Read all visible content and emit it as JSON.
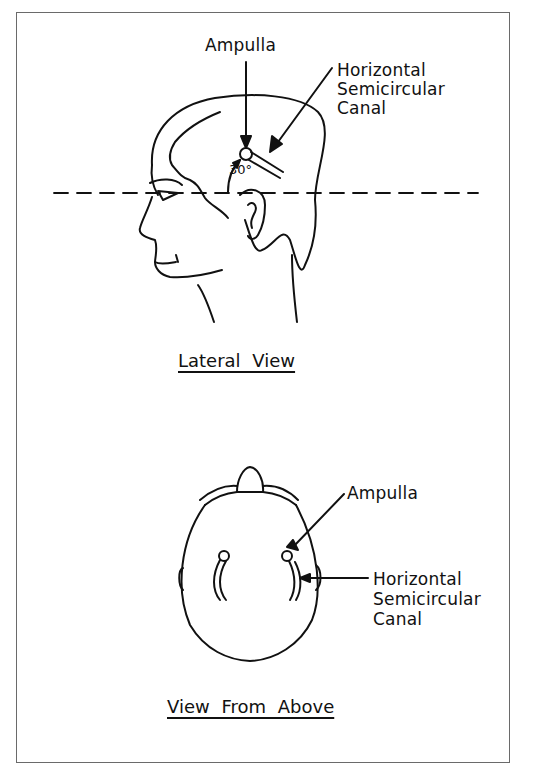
{
  "figure": {
    "panels": [
      {
        "id": "lateral",
        "title": "Lateral View",
        "labels": {
          "ampulla": "Ampulla",
          "canal_line1": "Horizontal",
          "canal_line2": "Semicircular",
          "canal_line3": "Canal",
          "angle": "30°"
        }
      },
      {
        "id": "above",
        "title": "View From Above",
        "labels": {
          "ampulla": "Ampulla",
          "canal_line1": "Horizontal",
          "canal_line2": "Semicircular",
          "canal_line3": "Canal"
        }
      }
    ],
    "colors": {
      "line": "#111111",
      "border": "#6a6a6a",
      "background": "#ffffff"
    }
  }
}
